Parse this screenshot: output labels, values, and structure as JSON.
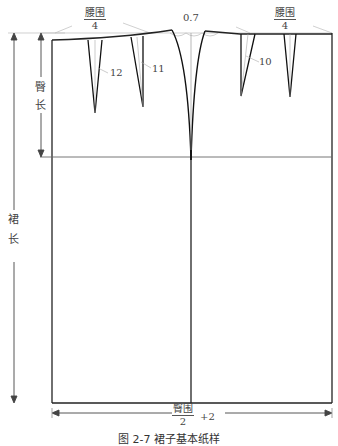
{
  "figure": {
    "caption": "图 2-7   裙子基本纸样",
    "waist_left": {
      "numerator": "腰围",
      "denominator": "4"
    },
    "waist_right": {
      "numerator": "腰围",
      "denominator": "4"
    },
    "side_raise": "0.7",
    "hip_width": {
      "numerator": "臀围",
      "denominator": "2",
      "suffix": "+2"
    },
    "hip_length": [
      "臀",
      "长"
    ],
    "skirt_length": [
      "裙",
      "长"
    ],
    "dart_lengths": {
      "back_1": "12",
      "back_2": "11",
      "front_1": "10"
    }
  }
}
